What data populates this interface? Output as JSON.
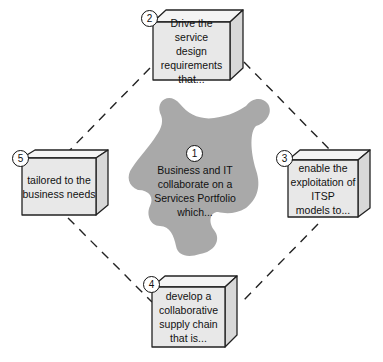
{
  "diagram": {
    "center": {
      "number": "1",
      "text": "Business and IT collaborate on a Services Portfolio which...",
      "lines": [
        "Business and IT",
        "collaborate on a",
        "Services Portfolio",
        "which..."
      ],
      "shape": "puzzle-piece",
      "fill": "#a9a9a9"
    },
    "steps": [
      {
        "number": "2",
        "lines": [
          "Drive the service",
          "design",
          "requirements",
          "that..."
        ],
        "position": "top"
      },
      {
        "number": "3",
        "lines": [
          "enable the",
          "exploitation of",
          "ITSP",
          "models to..."
        ],
        "position": "right"
      },
      {
        "number": "4",
        "lines": [
          "develop a",
          "collaborative",
          "supply chain",
          "that is..."
        ],
        "position": "bottom"
      },
      {
        "number": "5",
        "lines": [
          "tailored to the",
          "business needs"
        ],
        "position": "left"
      }
    ],
    "colors": {
      "box_front": "#e8e8e8",
      "box_top": "#f4f4f4",
      "box_side": "#d8d8d8",
      "outline": "#222222",
      "connector": "#222222"
    }
  }
}
